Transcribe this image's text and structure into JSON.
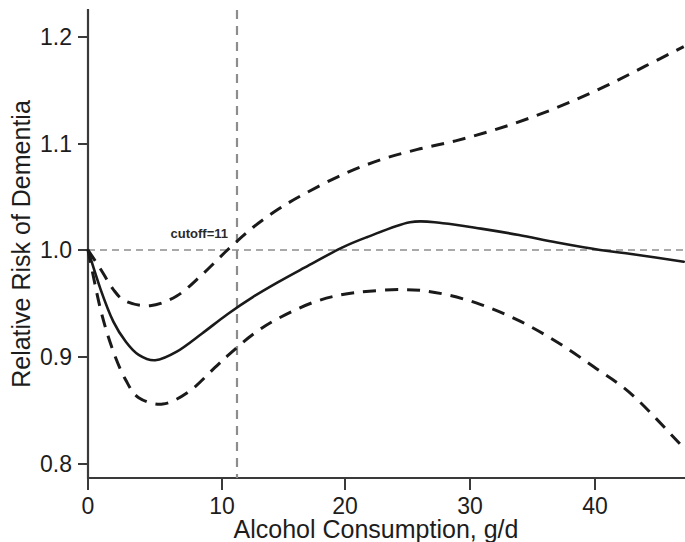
{
  "chart_data": {
    "type": "line",
    "title": "",
    "xlabel": "Alcohol Consumption, g/d",
    "ylabel": "Relative Risk of Dementia",
    "xlim": [
      0,
      47
    ],
    "ylim": [
      0.77,
      1.23
    ],
    "xticks": [
      "0",
      "10",
      "20",
      "30",
      "40"
    ],
    "xtick_values": [
      0,
      10,
      20,
      30,
      40
    ],
    "yticks": [
      "0.8",
      "0.9",
      "1.0",
      "1.1",
      "1.2"
    ],
    "ytick_values": [
      0.8,
      0.9,
      1.0,
      1.1,
      1.2
    ],
    "grid": false,
    "legend": "none",
    "annotations": [
      {
        "name": "cutoff-annotation",
        "text": "cutoff=11",
        "x": 11,
        "y": 1.012
      }
    ],
    "reference_lines": [
      {
        "name": "null-risk-reference",
        "orientation": "horizontal",
        "value": 1.0,
        "style": "dashed",
        "color": "#8d8d8d"
      },
      {
        "name": "cutoff-reference",
        "orientation": "vertical",
        "value": 11,
        "style": "dashed",
        "color": "#8d8d8d"
      }
    ],
    "series": [
      {
        "name": "Relative risk (fitted spline)",
        "style": "solid",
        "color": "#1a1a1a",
        "x": [
          0,
          1,
          2,
          3,
          4,
          5.3,
          7,
          9,
          11,
          13,
          15,
          17,
          20,
          22,
          25.4,
          28,
          31,
          34,
          37,
          40.4,
          43,
          47
        ],
        "values": [
          1.0,
          0.963,
          0.933,
          0.914,
          0.902,
          0.897,
          0.905,
          0.922,
          0.94,
          0.956,
          0.97,
          0.983,
          1.002,
          1.012,
          1.026,
          1.025,
          1.02,
          1.014,
          1.007,
          1.0,
          0.996,
          0.989
        ]
      },
      {
        "name": "Upper 95% confidence limit",
        "style": "dashed",
        "color": "#1a1a1a",
        "x": [
          0,
          1,
          2,
          3,
          4.9,
          7,
          9,
          11,
          13,
          15,
          17,
          20,
          23,
          26,
          29,
          32,
          35,
          38,
          41,
          44,
          47
        ],
        "values": [
          1.0,
          0.982,
          0.963,
          0.952,
          0.948,
          0.957,
          0.977,
          1.0,
          1.021,
          1.038,
          1.052,
          1.07,
          1.084,
          1.094,
          1.102,
          1.112,
          1.124,
          1.138,
          1.154,
          1.172,
          1.19
        ]
      },
      {
        "name": "Lower 95% confidence limit",
        "style": "dashed",
        "color": "#1a1a1a",
        "x": [
          0,
          1,
          2,
          3,
          4,
          5.9,
          8,
          10,
          11,
          13,
          15,
          18,
          21,
          25,
          28,
          31,
          34,
          37,
          40,
          43,
          47
        ],
        "values": [
          1.0,
          0.944,
          0.905,
          0.878,
          0.862,
          0.856,
          0.868,
          0.89,
          0.901,
          0.921,
          0.936,
          0.952,
          0.96,
          0.963,
          0.959,
          0.949,
          0.934,
          0.914,
          0.89,
          0.864,
          0.815
        ]
      }
    ]
  },
  "axes": {
    "y_axis_name": "relative-risk-axis",
    "x_axis_name": "alcohol-consumption-axis"
  }
}
